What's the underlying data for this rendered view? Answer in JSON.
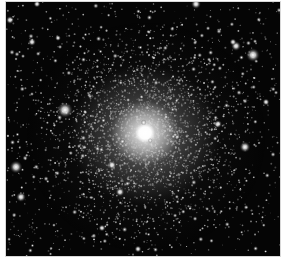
{
  "image": {
    "subject": "globular star cluster",
    "mode": "grayscale",
    "background_color": "#ffffff",
    "sky_color": "#050505",
    "core_color": "#ffffff",
    "core_center": [
      139,
      131
    ],
    "frame": {
      "x": 6,
      "y": 2,
      "width": 274,
      "height": 254
    },
    "bright_stars": [
      {
        "x": 59,
        "y": 108,
        "r": 3.2
      },
      {
        "x": 247,
        "y": 53,
        "r": 2.8
      },
      {
        "x": 230,
        "y": 44,
        "r": 2.0
      },
      {
        "x": 10,
        "y": 165,
        "r": 2.6
      },
      {
        "x": 239,
        "y": 145,
        "r": 2.2
      },
      {
        "x": 15,
        "y": 195,
        "r": 2.0
      },
      {
        "x": 190,
        "y": 2,
        "r": 2.0
      },
      {
        "x": 26,
        "y": 40,
        "r": 1.6
      },
      {
        "x": 106,
        "y": 163,
        "r": 1.8
      },
      {
        "x": 114,
        "y": 190,
        "r": 1.8
      },
      {
        "x": 212,
        "y": 122,
        "r": 1.6
      },
      {
        "x": 227,
        "y": 40,
        "r": 1.4
      },
      {
        "x": 4,
        "y": 18,
        "r": 1.6
      },
      {
        "x": 132,
        "y": 247,
        "r": 1.4
      },
      {
        "x": 31,
        "y": 2,
        "r": 1.4
      },
      {
        "x": 96,
        "y": 226,
        "r": 1.4
      },
      {
        "x": 52,
        "y": 36,
        "r": 1.2
      },
      {
        "x": 260,
        "y": 100,
        "r": 1.4
      }
    ],
    "star_field": {
      "seed": 7,
      "background_count": 900,
      "cluster_count": 2600,
      "cluster_sigma": 48
    }
  }
}
